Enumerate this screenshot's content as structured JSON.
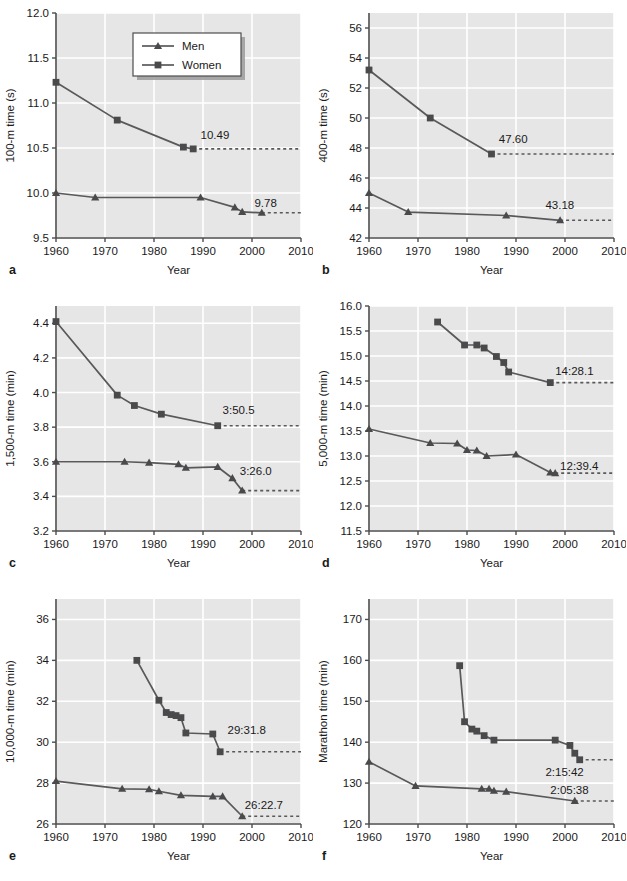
{
  "figure": {
    "panel_letters": [
      "a",
      "b",
      "c",
      "d",
      "e",
      "f"
    ],
    "legend": {
      "men_label": "Men",
      "women_label": "Women"
    },
    "colors": {
      "plot_background": "#e6e6e6",
      "gridline": "#ffffff",
      "axis": "#4d4d4d",
      "series": "#59595b",
      "marker": "#4a4a4c",
      "text": "#1a1a1a",
      "legend_background": "#ffffff",
      "legend_shadow": "#9a9a9a"
    },
    "shared_xlabel": "Year",
    "shared_xlim": [
      1960,
      2010
    ],
    "shared_xticks": [
      1960,
      1970,
      1980,
      1990,
      2000,
      2010
    ]
  },
  "chart_data": [
    {
      "panel": "a",
      "type": "line",
      "title": "",
      "xlabel": "Year",
      "ylabel": "100-m time (s)",
      "xlim": [
        1960,
        2010
      ],
      "ylim": [
        9.5,
        12.0
      ],
      "xticks": [
        1960,
        1970,
        1980,
        1990,
        2000,
        2010
      ],
      "yticks": [
        9.5,
        10.0,
        10.5,
        11.0,
        11.5,
        12.0
      ],
      "ytick_labels": [
        "9.5",
        "10.0",
        "10.5",
        "11.0",
        "11.5",
        "12.0"
      ],
      "grid": true,
      "legend": "inside-top-right",
      "series": [
        {
          "name": "Men",
          "marker": "triangle",
          "points": [
            [
              1960,
              10.0
            ],
            [
              1968,
              9.95
            ],
            [
              1989.5,
              9.95
            ],
            [
              1996.5,
              9.84
            ],
            [
              1998,
              9.79
            ],
            [
              2002,
              9.78
            ]
          ],
          "annotation": {
            "text": "9.78",
            "x": 2000.5,
            "y": 9.845
          },
          "record_line": {
            "value": 9.78,
            "from": 2002,
            "to": 2010
          }
        },
        {
          "name": "Women",
          "marker": "square",
          "points": [
            [
              1960,
              11.23
            ],
            [
              1972.5,
              10.81
            ],
            [
              1986,
              10.51
            ],
            [
              1988,
              10.49
            ]
          ],
          "annotation": {
            "text": "10.49",
            "x": 1989.5,
            "y": 10.6
          },
          "record_line": {
            "value": 10.49,
            "from": 1988,
            "to": 2010
          }
        }
      ]
    },
    {
      "panel": "b",
      "type": "line",
      "title": "",
      "xlabel": "Year",
      "ylabel": "400-m time (s)",
      "xlim": [
        1960,
        2010
      ],
      "ylim": [
        42,
        57
      ],
      "xticks": [
        1960,
        1970,
        1980,
        1990,
        2000,
        2010
      ],
      "yticks": [
        42,
        44,
        46,
        48,
        50,
        52,
        54,
        56
      ],
      "ytick_labels": [
        "42",
        "44",
        "46",
        "48",
        "50",
        "52",
        "54",
        "56"
      ],
      "grid": true,
      "legend": "none",
      "series": [
        {
          "name": "Men",
          "marker": "triangle",
          "points": [
            [
              1960,
              45.0
            ],
            [
              1968,
              43.73
            ],
            [
              1988,
              43.5
            ],
            [
              1999,
              43.18
            ]
          ],
          "annotation": {
            "text": "43.18",
            "x": 1996,
            "y": 43.95
          },
          "record_line": {
            "value": 43.18,
            "from": 1999,
            "to": 2010
          }
        },
        {
          "name": "Women",
          "marker": "square",
          "points": [
            [
              1960,
              53.2
            ],
            [
              1972.5,
              50.0
            ],
            [
              1985,
              47.6
            ]
          ],
          "annotation": {
            "text": "47.60",
            "x": 1986.5,
            "y": 48.35
          },
          "record_line": {
            "value": 47.6,
            "from": 1985,
            "to": 2010
          }
        }
      ]
    },
    {
      "panel": "c",
      "type": "line",
      "title": "",
      "xlabel": "Year",
      "ylabel": "1,500-m time (min)",
      "xlim": [
        1960,
        2010
      ],
      "ylim": [
        3.2,
        4.5
      ],
      "xticks": [
        1960,
        1970,
        1980,
        1990,
        2000,
        2010
      ],
      "yticks": [
        3.2,
        3.4,
        3.6,
        3.8,
        4.0,
        4.2,
        4.4
      ],
      "ytick_labels": [
        "3.2",
        "3.4",
        "3.6",
        "3.8",
        "4.0",
        "4.2",
        "4.4"
      ],
      "grid": true,
      "legend": "none",
      "series": [
        {
          "name": "Men",
          "marker": "triangle",
          "points": [
            [
              1960,
              3.6
            ],
            [
              1974,
              3.6
            ],
            [
              1979,
              3.595
            ],
            [
              1985,
              3.585
            ],
            [
              1986.5,
              3.565
            ],
            [
              1993,
              3.57
            ],
            [
              1996,
              3.505
            ],
            [
              1998,
              3.4333
            ]
          ],
          "annotation": {
            "text": "3:26.0",
            "x": 1997.5,
            "y": 3.525
          },
          "record_line": {
            "value": 3.4333,
            "from": 1998,
            "to": 2010
          }
        },
        {
          "name": "Women",
          "marker": "square",
          "points": [
            [
              1960,
              4.41
            ],
            [
              1972.5,
              3.985
            ],
            [
              1976,
              3.925
            ],
            [
              1981.5,
              3.875
            ],
            [
              1993,
              3.8083
            ]
          ],
          "annotation": {
            "text": "3:50.5",
            "x": 1994,
            "y": 3.875
          },
          "record_line": {
            "value": 3.8083,
            "from": 1993,
            "to": 2010
          }
        }
      ]
    },
    {
      "panel": "d",
      "type": "line",
      "title": "",
      "xlabel": "Year",
      "ylabel": "5,000-m time (min)",
      "xlim": [
        1960,
        2010
      ],
      "ylim": [
        11.5,
        16.0
      ],
      "xticks": [
        1960,
        1970,
        1980,
        1990,
        2000,
        2010
      ],
      "yticks": [
        11.5,
        12.0,
        12.5,
        13.0,
        13.5,
        14.0,
        14.5,
        15.0,
        15.5,
        16.0
      ],
      "ytick_labels": [
        "11.5",
        "12.0",
        "12.5",
        "13.0",
        "13.5",
        "14.0",
        "14.5",
        "15.0",
        "15.5",
        "16.0"
      ],
      "grid": true,
      "legend": "none",
      "series": [
        {
          "name": "Men",
          "marker": "triangle",
          "points": [
            [
              1960,
              13.54
            ],
            [
              1972.5,
              13.26
            ],
            [
              1978,
              13.25
            ],
            [
              1980,
              13.12
            ],
            [
              1982,
              13.11
            ],
            [
              1984,
              13.0
            ],
            [
              1990,
              13.03
            ],
            [
              1997,
              12.67
            ],
            [
              1998,
              12.6567
            ]
          ],
          "annotation": {
            "text": "12:39.4",
            "x": 1999,
            "y": 12.73
          },
          "record_line": {
            "value": 12.6567,
            "from": 1998,
            "to": 2010
          }
        },
        {
          "name": "Women",
          "marker": "square",
          "points": [
            [
              1974,
              15.68
            ],
            [
              1979.5,
              15.22
            ],
            [
              1982,
              15.22
            ],
            [
              1983.5,
              15.16
            ],
            [
              1986,
              14.99
            ],
            [
              1987.5,
              14.87
            ],
            [
              1988.5,
              14.68
            ],
            [
              1997,
              14.468
            ]
          ],
          "annotation": {
            "text": "14:28.1",
            "x": 1998,
            "y": 14.62
          },
          "record_line": {
            "value": 14.468,
            "from": 1997,
            "to": 2010
          }
        }
      ]
    },
    {
      "panel": "e",
      "type": "line",
      "title": "",
      "xlabel": "Year",
      "ylabel": "10,000-m time (min)",
      "xlim": [
        1960,
        2010
      ],
      "ylim": [
        26,
        37
      ],
      "xticks": [
        1960,
        1970,
        1980,
        1990,
        2000,
        2010
      ],
      "yticks": [
        26,
        28,
        30,
        32,
        34,
        36
      ],
      "ytick_labels": [
        "26",
        "28",
        "30",
        "32",
        "34",
        "36"
      ],
      "grid": true,
      "legend": "none",
      "series": [
        {
          "name": "Men",
          "marker": "triangle",
          "points": [
            [
              1960,
              28.1
            ],
            [
              1973.5,
              27.72
            ],
            [
              1979,
              27.7
            ],
            [
              1981,
              27.6
            ],
            [
              1985.5,
              27.4
            ],
            [
              1992,
              27.35
            ],
            [
              1994,
              27.35
            ],
            [
              1998,
              26.3783
            ]
          ],
          "annotation": {
            "text": "26:22.7",
            "x": 1998.5,
            "y": 26.75
          },
          "record_line": {
            "value": 26.3783,
            "from": 1998,
            "to": 2010
          }
        },
        {
          "name": "Women",
          "marker": "square",
          "points": [
            [
              1976.5,
              34.0
            ],
            [
              1981,
              32.05
            ],
            [
              1982.5,
              31.45
            ],
            [
              1983.5,
              31.35
            ],
            [
              1984.5,
              31.3
            ],
            [
              1985.5,
              31.2
            ],
            [
              1986.5,
              30.45
            ],
            [
              1992,
              30.4
            ],
            [
              1993.5,
              29.53
            ]
          ],
          "annotation": {
            "text": "29:31.8",
            "x": 1995,
            "y": 30.4
          },
          "record_line": {
            "value": 29.53,
            "from": 1993.5,
            "to": 2010
          }
        }
      ]
    },
    {
      "panel": "f",
      "type": "line",
      "title": "",
      "xlabel": "Year",
      "ylabel": "Marathon time (min)",
      "xlim": [
        1960,
        2010
      ],
      "ylim": [
        120,
        175
      ],
      "xticks": [
        1960,
        1970,
        1980,
        1990,
        2000,
        2010
      ],
      "yticks": [
        120,
        130,
        140,
        150,
        160,
        170
      ],
      "ytick_labels": [
        "120",
        "130",
        "140",
        "150",
        "160",
        "170"
      ],
      "grid": true,
      "legend": "none",
      "series": [
        {
          "name": "Men",
          "marker": "triangle",
          "points": [
            [
              1960,
              135.2
            ],
            [
              1969.5,
              129.3
            ],
            [
              1983,
              128.6
            ],
            [
              1984.5,
              128.6
            ],
            [
              1985.5,
              128.1
            ],
            [
              1988,
              127.9
            ],
            [
              2002,
              125.63
            ]
          ],
          "annotation": {
            "text": "2:05:38",
            "x": 1997,
            "y": 127.3
          },
          "record_line": {
            "value": 125.63,
            "from": 2002,
            "to": 2010
          }
        },
        {
          "name": "Women",
          "marker": "square",
          "points": [
            [
              1978.5,
              158.7
            ],
            [
              1979.5,
              145.0
            ],
            [
              1981,
              143.2
            ],
            [
              1982,
              142.7
            ],
            [
              1983.5,
              141.6
            ],
            [
              1985.5,
              140.5
            ],
            [
              1998,
              140.5
            ],
            [
              2001,
              139.2
            ],
            [
              2002,
              137.3
            ],
            [
              2003,
              135.7
            ]
          ],
          "annotation": {
            "text": "2:15:42",
            "x": 1996,
            "y": 131.8
          },
          "record_line": {
            "value": 135.7,
            "from": 2003,
            "to": 2010
          }
        }
      ]
    }
  ]
}
